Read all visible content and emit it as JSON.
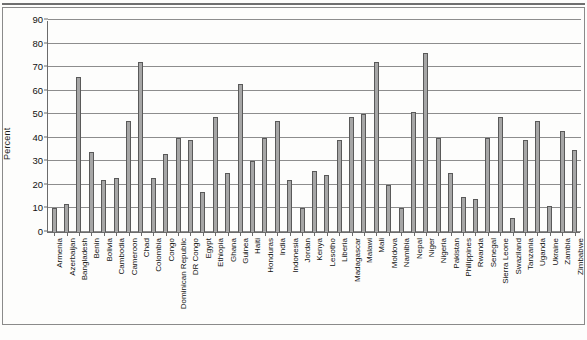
{
  "chart_data": {
    "type": "bar",
    "title": "",
    "xlabel": "",
    "ylabel": "Percent",
    "ylim": [
      0,
      90
    ],
    "yticks": [
      0,
      10,
      20,
      30,
      40,
      50,
      60,
      70,
      80,
      90
    ],
    "grid": true,
    "legend": false,
    "bar_color": "#a6a6a6",
    "bar_edge_color": "#595959",
    "categories": [
      "Armenia",
      "Azerbaijan",
      "Bangladesh",
      "Benin",
      "Bolivia",
      "Cambodia",
      "Cameroon",
      "Chad",
      "Colombia",
      "Congo",
      "Dominican Republic",
      "DR Congo",
      "Egypt",
      "Ethiopia",
      "Ghana",
      "Guinea",
      "Haiti",
      "Honduras",
      "India",
      "Indonesia",
      "Jordan",
      "Kenya",
      "Lesotho",
      "Liberia",
      "Madagascar",
      "Malawi",
      "Mali",
      "Moldova",
      "Namibia",
      "Nepal",
      "Niger",
      "Nigeria",
      "Pakistan",
      "Philippines",
      "Rwanda",
      "Senegal",
      "Sierra Leone",
      "Swaziland",
      "Tanzania",
      "Uganda",
      "Ukraine",
      "Zambia",
      "Zimbabwe"
    ],
    "values": [
      10,
      12,
      66,
      34,
      22,
      23,
      47,
      72,
      23,
      33,
      40,
      39,
      17,
      49,
      25,
      63,
      30,
      40,
      47,
      22,
      10,
      26,
      24,
      39,
      49,
      50,
      72,
      20,
      10,
      51,
      76,
      40,
      25,
      15,
      14,
      40,
      49,
      6,
      39,
      47,
      11,
      43,
      35
    ]
  }
}
